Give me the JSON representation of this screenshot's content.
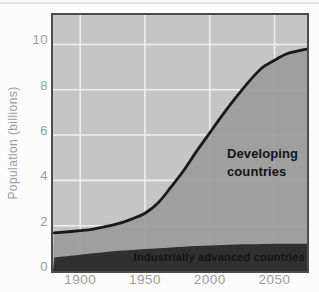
{
  "figure": {
    "labels": {
      "developing": "Developing\ncountries",
      "advanced": "Industrially advanced countries"
    }
  },
  "chart_data": {
    "type": "area",
    "title": "",
    "xlabel": "",
    "ylabel": "Population (billions)",
    "x": [
      1880,
      1900,
      1910,
      1920,
      1930,
      1940,
      1950,
      1960,
      1970,
      1980,
      1990,
      2000,
      2010,
      2020,
      2030,
      2040,
      2050,
      2060,
      2075
    ],
    "series": [
      {
        "name": "Total world population (top of Developing countries area)",
        "values": [
          1.68,
          1.78,
          1.85,
          1.97,
          2.1,
          2.3,
          2.55,
          3.0,
          3.7,
          4.45,
          5.3,
          6.1,
          6.9,
          7.65,
          8.35,
          8.95,
          9.3,
          9.6,
          9.8
        ],
        "fill": "#9a9a9a",
        "line_color": "#1a1a1a"
      },
      {
        "name": "Industrially advanced countries",
        "values": [
          0.6,
          0.72,
          0.78,
          0.84,
          0.89,
          0.93,
          0.97,
          1.0,
          1.04,
          1.07,
          1.1,
          1.13,
          1.15,
          1.17,
          1.18,
          1.19,
          1.2,
          1.2,
          1.2
        ],
        "fill": "#2a2a2a",
        "line_color": null
      }
    ],
    "xticks": [
      1900,
      1950,
      2000,
      2050
    ],
    "yticks": [
      0,
      2,
      4,
      6,
      8,
      10
    ],
    "xlim": [
      1879,
      2075
    ],
    "ylim": [
      0,
      11.3
    ],
    "grid": true,
    "legend": null,
    "annotations": [
      "Developing countries",
      "Industrially advanced countries"
    ],
    "colors": {
      "plot_background": "#c5c5c5",
      "gridline": "#efefef",
      "frame": "#4c4c4c",
      "tick_label": "#9b9b9b",
      "annotation_text": "#141414",
      "curve": "#1a1a1a",
      "page_background": "#fcfcfc",
      "page_edge_line": "#d8d8d8"
    }
  }
}
